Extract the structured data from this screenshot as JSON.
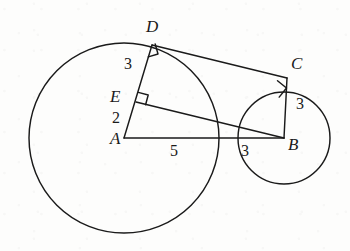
{
  "figure": {
    "kind": "geometry-diagram",
    "stroke_color": "#1a1a1a",
    "background_color": "#fdfdfc",
    "points": {
      "A": {
        "label": "A",
        "x": 124,
        "y": 138,
        "label_x": 112,
        "label_y": 131
      },
      "B": {
        "label": "B",
        "x": 284,
        "y": 138,
        "label_x": 288,
        "label_y": 138
      },
      "C": {
        "label": "C",
        "x": 287,
        "y": 78,
        "label_x": 291,
        "label_y": 62
      },
      "D": {
        "label": "D",
        "x": 152,
        "y": 45,
        "label_x": 148,
        "label_y": 22
      },
      "E": {
        "label": "E",
        "x": 136,
        "y": 102,
        "label_x": 112,
        "label_y": 95
      }
    },
    "circles": [
      {
        "name": "circle-A",
        "center": "A",
        "cx": 124,
        "cy": 138,
        "r": 95
      },
      {
        "name": "circle-B",
        "center": "B",
        "cx": 284,
        "cy": 138,
        "r": 46
      }
    ],
    "segments": [
      {
        "name": "segment-AD",
        "from": "A",
        "to": "D",
        "x1": 124,
        "y1": 138,
        "x2": 152,
        "y2": 45
      },
      {
        "name": "segment-DC",
        "from": "D",
        "to": "C",
        "x1": 152,
        "y1": 45,
        "x2": 287,
        "y2": 78
      },
      {
        "name": "segment-CB",
        "from": "C",
        "to": "B",
        "x1": 287,
        "y1": 78,
        "x2": 284,
        "y2": 138
      },
      {
        "name": "segment-AB",
        "from": "A",
        "to": "B",
        "x1": 124,
        "y1": 138,
        "x2": 284,
        "y2": 138
      },
      {
        "name": "segment-EB",
        "from": "E",
        "to": "B",
        "x1": 136,
        "y1": 102,
        "x2": 284,
        "y2": 138
      }
    ],
    "right_angle_marks": [
      {
        "name": "right-angle-at-D",
        "at": "D",
        "x": 152,
        "y": 45
      },
      {
        "name": "right-angle-at-E",
        "at": "E",
        "x": 136,
        "y": 102
      },
      {
        "name": "right-angle-at-C",
        "at": "C",
        "x": 287,
        "y": 78
      }
    ],
    "measures": {
      "DE": {
        "value": "3",
        "x": 126,
        "y": 60,
        "of": "segment-DE"
      },
      "EA": {
        "value": "2",
        "x": 114,
        "y": 112,
        "of": "segment-EA"
      },
      "AX": {
        "value": "5",
        "x": 172,
        "y": 144,
        "of": "segment-A-to-intersection"
      },
      "XB": {
        "value": "3",
        "x": 243,
        "y": 144,
        "of": "segment-intersection-to-B"
      },
      "CB": {
        "value": "3",
        "x": 297,
        "y": 104,
        "of": "segment-CB"
      }
    }
  }
}
